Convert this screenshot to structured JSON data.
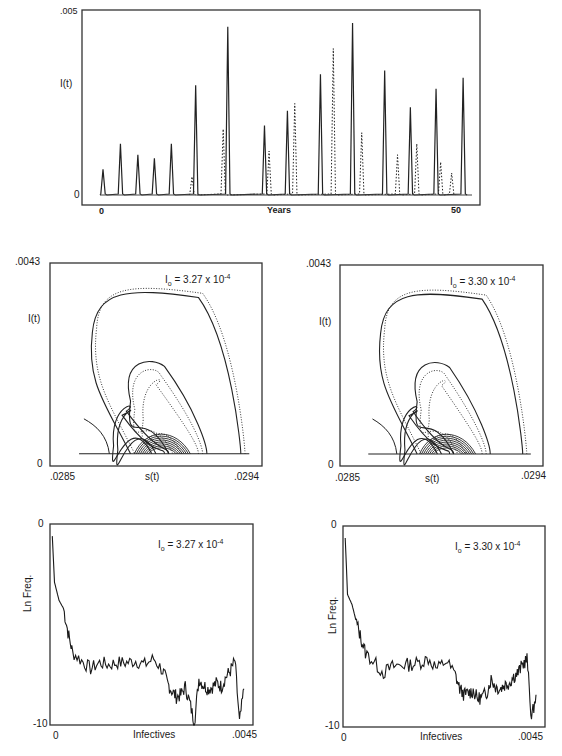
{
  "chart_data": [
    {
      "id": "time_series",
      "type": "line",
      "title": "",
      "xlabel": "Years",
      "ylabel": "I(t)",
      "xlim": [
        0,
        50
      ],
      "ylim": [
        0,
        0.005
      ],
      "x_ticks": [
        "0",
        "50"
      ],
      "y_ticks": [
        ".005",
        "0"
      ],
      "grid": false,
      "series": [
        {
          "name": "run A (solid)",
          "style": "solid",
          "peaks": [
            {
              "x": 0.0,
              "y": 0.0007
            },
            {
              "x": 3.8,
              "y": 0.0014
            },
            {
              "x": 7.6,
              "y": 0.0011
            },
            {
              "x": 11.2,
              "y": 0.001
            },
            {
              "x": 14.9,
              "y": 0.0014
            },
            {
              "x": 20.2,
              "y": 0.003
            },
            {
              "x": 27.2,
              "y": 0.0046
            },
            {
              "x": 35.2,
              "y": 0.0019
            },
            {
              "x": 40.2,
              "y": 0.0023
            },
            {
              "x": 47.4,
              "y": 0.0033
            },
            {
              "x": 54.4,
              "y": 0.0047
            },
            {
              "x": 61.4,
              "y": 0.0034
            },
            {
              "x": 67.0,
              "y": 0.0024
            },
            {
              "x": 72.6,
              "y": 0.0029
            },
            {
              "x": 78.5,
              "y": 0.0032
            }
          ]
        },
        {
          "name": "run B (dotted)",
          "style": "dotted",
          "peaks": [
            {
              "x": 19.4,
              "y": 0.0005
            },
            {
              "x": 26.2,
              "y": 0.0018
            },
            {
              "x": 36.2,
              "y": 0.0012
            },
            {
              "x": 41.8,
              "y": 0.0025
            },
            {
              "x": 50.2,
              "y": 0.004
            },
            {
              "x": 56.4,
              "y": 0.0017
            },
            {
              "x": 64.2,
              "y": 0.0011
            },
            {
              "x": 68.4,
              "y": 0.0014
            },
            {
              "x": 73.6,
              "y": 0.0009
            },
            {
              "x": 76.0,
              "y": 0.0006
            }
          ]
        }
      ]
    },
    {
      "id": "phase_left",
      "type": "scatter",
      "annotation": {
        "base": "I",
        "sub": "o",
        "text": " = 3.27 x 10",
        "sup": "-4"
      },
      "xlabel": "s(t)",
      "ylabel": "I(t)",
      "xlim": [
        0.0285,
        0.0294
      ],
      "ylim": [
        0,
        0.0043
      ],
      "x_ticks": [
        ".0285",
        ".0294"
      ],
      "y_ticks": [
        ".0043",
        "0"
      ],
      "description": "Nested loop orbits in s-I phase plane; outer loop peaks near I=0.0040 at s~0.02868"
    },
    {
      "id": "phase_right",
      "type": "scatter",
      "annotation": {
        "base": "I",
        "sub": "o",
        "text": " = 3.30 x 10",
        "sup": "-4"
      },
      "xlabel": "s(t)",
      "ylabel": "I(t)",
      "xlim": [
        0.0285,
        0.0294
      ],
      "ylim": [
        0,
        0.0043
      ],
      "x_ticks": [
        ".0285",
        ".0294"
      ],
      "y_ticks": [
        ".0043",
        "0"
      ]
    },
    {
      "id": "hist_left",
      "type": "line",
      "annotation": {
        "base": "I",
        "sub": "o",
        "text": " = 3.27 x 10",
        "sup": "-4"
      },
      "xlabel": "Infectives",
      "ylabel": "Ln Freq.",
      "xlim": [
        0,
        0.0045
      ],
      "ylim": [
        -10,
        0
      ],
      "x_ticks": [
        "0",
        ".0045"
      ],
      "y_ticks": [
        "0",
        "-10"
      ],
      "x": [
        5e-05,
        0.0001,
        0.0002,
        0.0003,
        0.0004,
        0.0005,
        0.0007,
        0.0009,
        0.0011,
        0.0013,
        0.0015,
        0.0017,
        0.0019,
        0.0021,
        0.0023,
        0.0025,
        0.0026,
        0.0027,
        0.0028,
        0.0029,
        0.003,
        0.0031,
        0.0032,
        0.0033,
        0.0034,
        0.0035,
        0.0036,
        0.0037,
        0.0038,
        0.0039,
        0.004,
        0.0041,
        0.0042,
        0.0043
      ],
      "values": [
        -0.6,
        -2.9,
        -3.8,
        -4.2,
        -5.4,
        -6.4,
        -6.8,
        -7.2,
        -6.9,
        -7.0,
        -6.9,
        -6.9,
        -6.8,
        -7.0,
        -6.7,
        -7.3,
        -7.9,
        -8.3,
        -8.6,
        -8.5,
        -8.1,
        -8.9,
        -9.9,
        -7.7,
        -8.0,
        -8.2,
        -8.1,
        -7.9,
        -8.1,
        -7.6,
        -7.3,
        -6.8,
        -9.9,
        -8.2
      ]
    },
    {
      "id": "hist_right",
      "type": "line",
      "annotation": {
        "base": "I",
        "sub": "o",
        "text": " = 3.30 x 10",
        "sup": "-4"
      },
      "xlabel": "Infectives",
      "ylabel": "Ln Freq.",
      "xlim": [
        0,
        0.0045
      ],
      "ylim": [
        -10,
        0
      ],
      "x_ticks": [
        "0",
        ".0045"
      ],
      "y_ticks": [
        "0",
        "-10"
      ],
      "x": [
        5e-05,
        0.0001,
        0.0002,
        0.0003,
        0.0004,
        0.0005,
        0.0007,
        0.0009,
        0.0011,
        0.0013,
        0.0015,
        0.0017,
        0.0019,
        0.0021,
        0.0023,
        0.0025,
        0.0026,
        0.0027,
        0.0028,
        0.0029,
        0.003,
        0.0031,
        0.0032,
        0.0033,
        0.0034,
        0.0035,
        0.0036,
        0.0037,
        0.0038,
        0.0039,
        0.004,
        0.0041,
        0.0042,
        0.0043
      ],
      "values": [
        -0.6,
        -3.4,
        -3.9,
        -4.8,
        -5.6,
        -6.3,
        -6.8,
        -7.3,
        -7.0,
        -6.9,
        -6.9,
        -6.8,
        -6.6,
        -7.1,
        -6.7,
        -7.4,
        -8.1,
        -8.4,
        -8.3,
        -8.2,
        -8.6,
        -8.5,
        -8.3,
        -7.6,
        -8.0,
        -8.1,
        -7.9,
        -7.8,
        -7.5,
        -7.3,
        -6.9,
        -6.6,
        -9.6,
        -8.4
      ]
    }
  ]
}
